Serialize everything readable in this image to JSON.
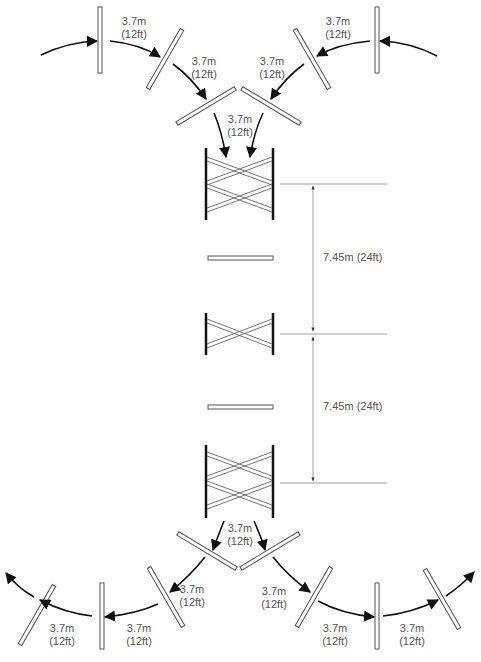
{
  "diagram": {
    "title": "",
    "colors": {
      "line": "#222222",
      "bar": "#555555",
      "text": "#555555",
      "dim_line": "#888888"
    },
    "spacing_label": {
      "metric": "3.7m",
      "imperial": "(12ft)"
    },
    "dimensions": [
      {
        "label": "7.45m (24ft)"
      },
      {
        "label": "7.45m (24ft)"
      }
    ],
    "top_labels": [
      {
        "metric": "3.7m",
        "imperial": "(12ft)"
      },
      {
        "metric": "3.7m",
        "imperial": "(12ft)"
      },
      {
        "metric": "3.7m",
        "imperial": "(12ft)"
      },
      {
        "metric": "3.7m",
        "imperial": "(12ft)"
      },
      {
        "metric": "3.7m",
        "imperial": "(12ft)"
      }
    ],
    "bottom_labels": [
      {
        "metric": "3.7m",
        "imperial": "(12ft)"
      },
      {
        "metric": "3.7m",
        "imperial": "(12ft)"
      },
      {
        "metric": "3.7m",
        "imperial": "(12ft)"
      },
      {
        "metric": "3.7m",
        "imperial": "(12ft)"
      },
      {
        "metric": "3.7m",
        "imperial": "(12ft)"
      },
      {
        "metric": "3.7m",
        "imperial": "(12ft)"
      },
      {
        "metric": "3.7m",
        "imperial": "(12ft)"
      }
    ],
    "elements": {
      "fences": [
        "top-cross-gate",
        "rail-1",
        "middle-cross-gate",
        "rail-2",
        "bottom-cross-gate"
      ],
      "approach_poles": 5,
      "exit_poles": 8
    }
  }
}
